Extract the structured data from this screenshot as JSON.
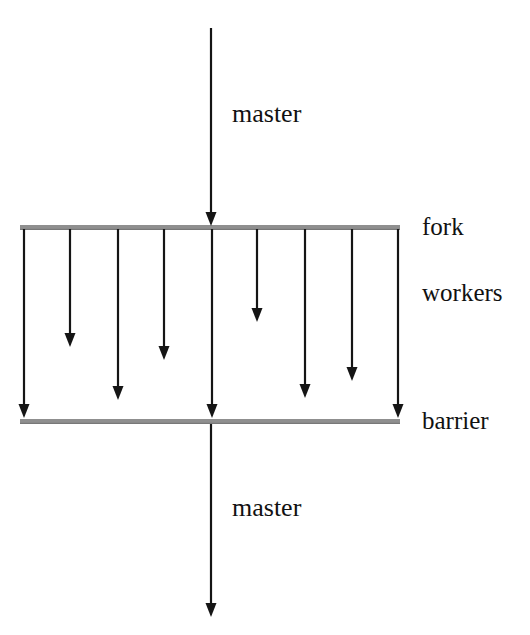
{
  "diagram": {
    "canvas": {
      "width": 530,
      "height": 635,
      "background": "#ffffff"
    },
    "colors": {
      "stroke": "#151515",
      "bar": "#8f8f8f",
      "bar_shade": "#707070",
      "text": "#111111",
      "background": "#ffffff"
    },
    "labels": {
      "master_top": "master",
      "master_bottom": "master",
      "fork": "fork",
      "workers": "workers",
      "barrier": "barrier"
    },
    "bars": [
      {
        "name": "fork",
        "x1": 20,
        "x2": 400,
        "y": 225,
        "thickness": 5,
        "color": "#8f8f8f"
      },
      {
        "name": "barrier",
        "x1": 20,
        "x2": 400,
        "y": 419,
        "thickness": 5,
        "color": "#8f8f8f"
      }
    ],
    "master_arrows": [
      {
        "name": "master-in",
        "x": 211,
        "y1": 28,
        "y2": 226,
        "head": "down"
      },
      {
        "name": "master-out",
        "x": 211,
        "y1": 424,
        "y2": 617,
        "head": "down"
      }
    ],
    "worker_arrows": [
      {
        "index": 1,
        "x": 24,
        "y1": 229,
        "y2": 418,
        "reaches_barrier": true
      },
      {
        "index": 2,
        "x": 70,
        "y1": 229,
        "y2": 347,
        "reaches_barrier": false
      },
      {
        "index": 3,
        "x": 118,
        "y1": 229,
        "y2": 400,
        "reaches_barrier": false
      },
      {
        "index": 4,
        "x": 164,
        "y1": 229,
        "y2": 360,
        "reaches_barrier": false
      },
      {
        "index": 5,
        "x": 212,
        "y1": 229,
        "y2": 418,
        "reaches_barrier": true
      },
      {
        "index": 6,
        "x": 257,
        "y1": 229,
        "y2": 322,
        "reaches_barrier": false
      },
      {
        "index": 7,
        "x": 305,
        "y1": 229,
        "y2": 398,
        "reaches_barrier": false
      },
      {
        "index": 8,
        "x": 352,
        "y1": 229,
        "y2": 381,
        "reaches_barrier": false
      },
      {
        "index": 9,
        "x": 398,
        "y1": 229,
        "y2": 418,
        "reaches_barrier": true
      }
    ],
    "arrow_style": {
      "shaft_width": 2.2,
      "head_width": 11,
      "head_length": 14
    }
  }
}
